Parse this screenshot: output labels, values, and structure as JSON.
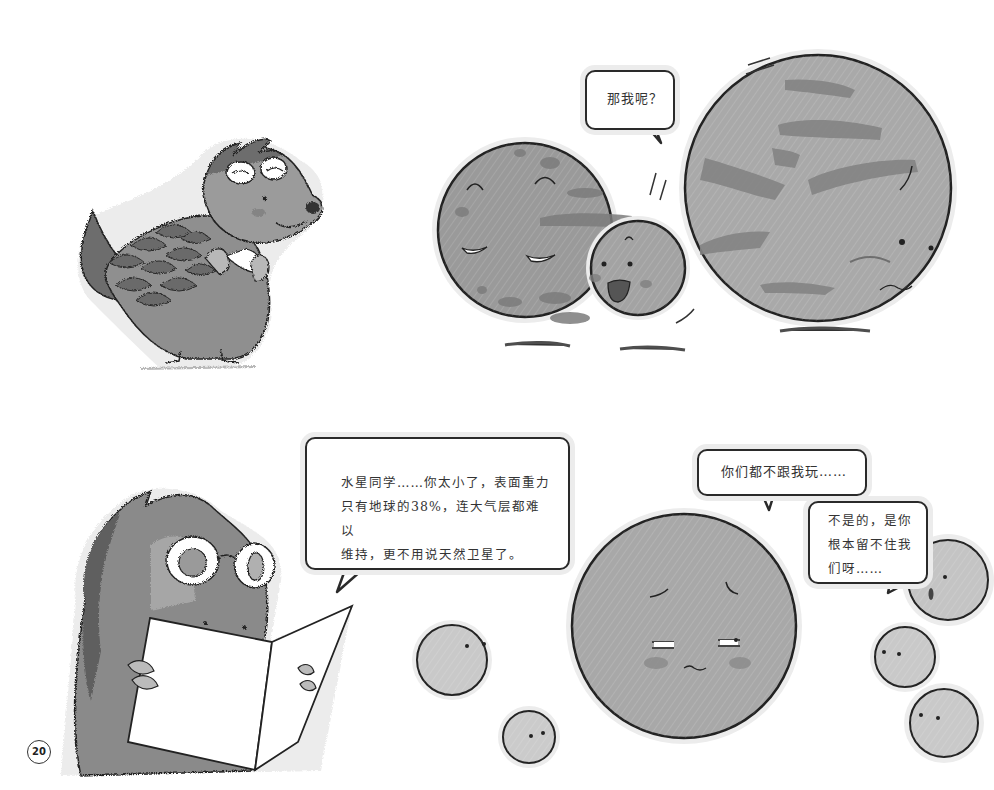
{
  "page": {
    "number": "20",
    "background": "#ffffff"
  },
  "colors": {
    "character_dark": "#5e5e5e",
    "character_mid": "#8c8c8c",
    "character_light": "#b4b4b4",
    "planet_mercury_fill": "#9a9a9a",
    "planet_mercury_spots": "#7c7c7c",
    "planet_mars_fill": "#a9a9a9",
    "planet_mars_bands": "#848484",
    "moon_fill": "#c9c9c9",
    "outline": "#222222",
    "bubble_border": "#2a2a2a",
    "halo": "#ececec"
  },
  "panels": [
    {
      "id": "top-left",
      "scene": "pangolin character with glasses, hands clasped, looking right"
    },
    {
      "id": "top-right",
      "scene": "two large planets and one small moon bumping in",
      "speech": {
        "text": "那我呢？"
      }
    },
    {
      "id": "bottom-left",
      "scene": "pangolin character reading an open book",
      "speech": {
        "text": "水星同学……你太小了，表面重力\n只有地球的38%，连大气层都难以\n维持，更不用说天然卫星了。"
      }
    },
    {
      "id": "bottom-right",
      "scene": "sad planet surrounded by small moons drifting away",
      "speech_planet": {
        "text": "你们都不跟我玩……"
      },
      "speech_moons": {
        "text": "不是的，是你\n根本留不住我\n们呀……"
      }
    }
  ]
}
